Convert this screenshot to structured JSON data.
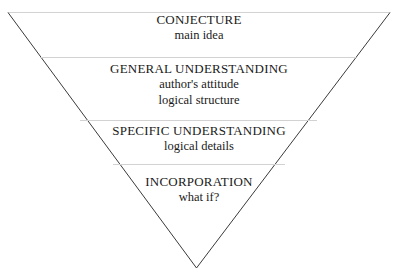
{
  "diagram": {
    "type": "inverted-pyramid",
    "shape": "inverted triangle",
    "background_color": "#ffffff",
    "outline_color": "#3a3a3a",
    "divider_color": "#d2d2d2",
    "text_color": "#1a1a1a",
    "bands": [
      {
        "id": "conjecture",
        "title": "CONJECTURE",
        "lines": [
          "main idea"
        ]
      },
      {
        "id": "general-understanding",
        "title": "GENERAL UNDERSTANDING",
        "lines": [
          "author's attitude",
          "logical structure"
        ]
      },
      {
        "id": "specific-understanding",
        "title": "SPECIFIC UNDERSTANDING",
        "lines": [
          "logical details"
        ]
      },
      {
        "id": "incorporation",
        "title": "INCORPORATION",
        "lines": [
          "what if?"
        ]
      }
    ]
  }
}
